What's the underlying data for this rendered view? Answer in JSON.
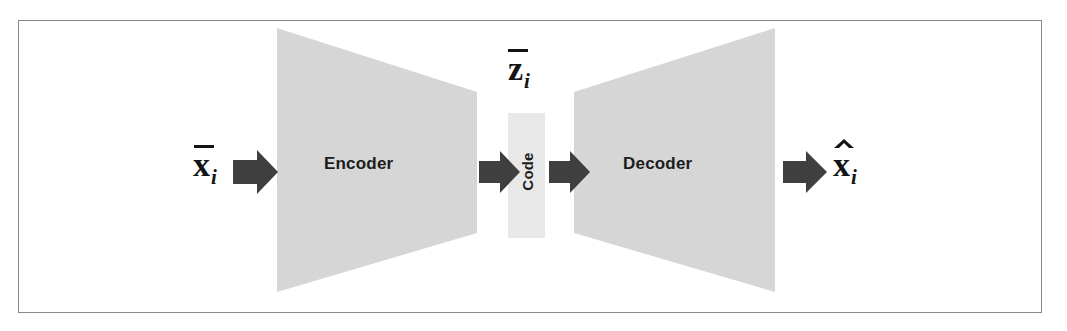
{
  "figure": {
    "background_color": "#ffffff",
    "border_color": "#8a8a8a"
  },
  "colors": {
    "block_fill": "#d6d6d6",
    "code_fill": "#e8e8e8",
    "arrow_fill": "#3f3f3f",
    "text_color": "#1c1c1c"
  },
  "blocks": {
    "encoder": {
      "label": "Encoder",
      "shape": "trapezoid-narrowing-right"
    },
    "code": {
      "label": "Code",
      "shape": "rectangle",
      "orientation": "vertical"
    },
    "decoder": {
      "label": "Decoder",
      "shape": "trapezoid-widening-right"
    }
  },
  "labels": {
    "input": {
      "base": "x",
      "subscript": "i",
      "accent": "bar",
      "text": "x̄i"
    },
    "latent": {
      "base": "z",
      "subscript": "i",
      "accent": "bar",
      "text": "z̄i"
    },
    "output": {
      "base": "x",
      "subscript": "i",
      "accent": "hat",
      "text": "x̂i"
    }
  },
  "arrows": [
    {
      "name": "input-to-encoder"
    },
    {
      "name": "encoder-to-code"
    },
    {
      "name": "code-to-decoder"
    },
    {
      "name": "decoder-to-output"
    }
  ]
}
